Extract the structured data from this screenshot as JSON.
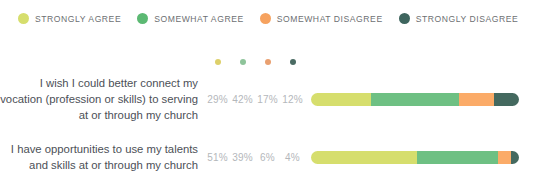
{
  "legend": {
    "items": [
      {
        "label": "STRONGLY AGREE",
        "color": "#d6de6d",
        "icon": "legend-dot-icon"
      },
      {
        "label": "SOMEWHAT AGREE",
        "color": "#5cb973",
        "icon": "legend-dot-icon"
      },
      {
        "label": "SOMEWHAT DISAGREE",
        "color": "#f6a25f",
        "icon": "legend-dot-icon"
      },
      {
        "label": "STRONGLY DISAGREE",
        "color": "#3e655e",
        "icon": "legend-dot-icon"
      }
    ]
  },
  "column_dots": [
    {
      "color": "#ddd06a",
      "icon": "column-marker-dot-icon"
    },
    {
      "color": "#8ec49a",
      "icon": "column-marker-dot-icon"
    },
    {
      "color": "#e9a070",
      "icon": "column-marker-dot-icon"
    },
    {
      "color": "#4a6b63",
      "icon": "column-marker-dot-icon"
    }
  ],
  "chart_data": {
    "type": "bar",
    "title": "",
    "xlabel": "",
    "ylabel": "",
    "grid": false,
    "legend_position": "top-left",
    "stacked": true,
    "normalized": true,
    "xlim": [
      0,
      100
    ],
    "series": [
      {
        "name": "STRONGLY AGREE",
        "color": "#d6de6d",
        "values": [
          29,
          51
        ]
      },
      {
        "name": "SOMEWHAT AGREE",
        "color": "#6ec083",
        "values": [
          42,
          39
        ]
      },
      {
        "name": "SOMEWHAT DISAGREE",
        "color": "#fbab68",
        "values": [
          17,
          6
        ]
      },
      {
        "name": "STRONGLY DISAGREE",
        "color": "#44695f",
        "values": [
          12,
          4
        ]
      }
    ],
    "categories": [
      "I wish I could better connect my vocation (profession or skills) to serving at or through my church",
      "I have opportunities to use my talents and skills at or through my church"
    ],
    "rows": [
      {
        "label": "I wish I could better connect my vocation (profession or skills) to serving at or through my church",
        "percents": [
          "29%",
          "42%",
          "17%",
          "12%"
        ],
        "segments": [
          {
            "name": "STRONGLY AGREE",
            "value": 29,
            "color": "#d6de6d"
          },
          {
            "name": "SOMEWHAT AGREE",
            "value": 42,
            "color": "#6ec083"
          },
          {
            "name": "SOMEWHAT DISAGREE",
            "value": 17,
            "color": "#fbab68"
          },
          {
            "name": "STRONGLY DISAGREE",
            "value": 12,
            "color": "#44695f"
          }
        ]
      },
      {
        "label": "I have opportunities to use my talents and skills at or through my church",
        "percents": [
          "51%",
          "39%",
          "6%",
          "4%"
        ],
        "segments": [
          {
            "name": "STRONGLY AGREE",
            "value": 51,
            "color": "#d6de6d"
          },
          {
            "name": "SOMEWHAT AGREE",
            "value": 39,
            "color": "#6ec083"
          },
          {
            "name": "SOMEWHAT DISAGREE",
            "value": 6,
            "color": "#fbab68"
          },
          {
            "name": "STRONGLY DISAGREE",
            "value": 4,
            "color": "#44695f"
          }
        ]
      }
    ]
  }
}
